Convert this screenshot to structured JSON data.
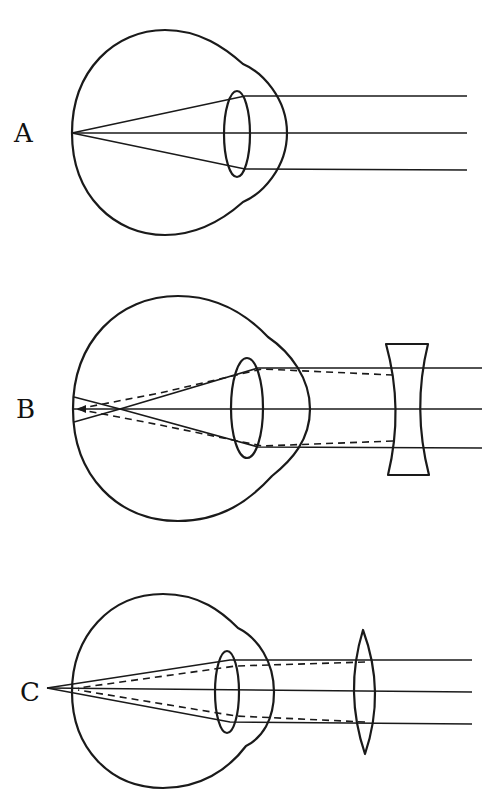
{
  "figure": {
    "panels": [
      {
        "id": "A",
        "label": "A",
        "description": "Normal (emmetropic) eye: parallel rays focus on the retina"
      },
      {
        "id": "B",
        "label": "B",
        "description": "Myopic eye corrected with a concave (diverging) lens"
      },
      {
        "id": "C",
        "label": "C",
        "description": "Hyperopic eye corrected with a convex (converging) lens"
      }
    ]
  },
  "colors": {
    "ink": "#1a1a1a",
    "background": "#ffffff"
  }
}
